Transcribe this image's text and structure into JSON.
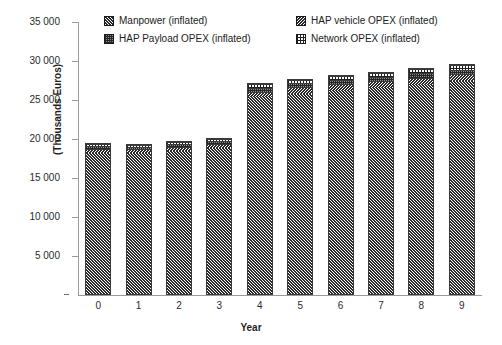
{
  "chart_data": {
    "type": "bar",
    "stacked": true,
    "title": "",
    "xlabel": "Year",
    "ylabel": "(Thousands Euros)",
    "categories": [
      "0",
      "1",
      "2",
      "3",
      "4",
      "5",
      "6",
      "7",
      "8",
      "9"
    ],
    "ylim": [
      0,
      35000
    ],
    "ytick_values": [
      0,
      5000,
      10000,
      15000,
      20000,
      25000,
      30000,
      35000
    ],
    "ytick_labels": [
      "-",
      "5 000",
      "10 000",
      "15 000",
      "20 000",
      "25 000",
      "30 000",
      "35 000"
    ],
    "grid": false,
    "legend_position": "top",
    "series": [
      {
        "name": "Manpower (inflated)",
        "pattern": "diagonal-hatch",
        "values": [
          18100,
          18050,
          18300,
          18700,
          25200,
          25700,
          26100,
          26500,
          26900,
          27300
        ]
      },
      {
        "name": "HAP vehicle OPEX (inflated)",
        "pattern": "diagonal-hatch-reverse",
        "values": [
          500,
          500,
          520,
          540,
          750,
          780,
          800,
          820,
          840,
          860
        ]
      },
      {
        "name": "HAP Payload OPEX (inflated)",
        "pattern": "dense-checker",
        "values": [
          350,
          350,
          360,
          370,
          500,
          520,
          540,
          560,
          580,
          600
        ]
      },
      {
        "name": "Network OPEX (inflated)",
        "pattern": "grid-lines",
        "values": [
          250,
          250,
          260,
          270,
          450,
          470,
          490,
          510,
          530,
          550
        ]
      }
    ],
    "totals": [
      19200,
      19150,
      19440,
      19880,
      26900,
      27470,
      27930,
      28390,
      28850,
      29310
    ]
  },
  "legend": {
    "items": [
      {
        "label": "Manpower (inflated)",
        "pattern_class": "pat-manpower"
      },
      {
        "label": "HAP vehicle OPEX (inflated)",
        "pattern_class": "pat-vehicle"
      },
      {
        "label": "HAP Payload OPEX (inflated)",
        "pattern_class": "pat-payload"
      },
      {
        "label": "Network OPEX (inflated)",
        "pattern_class": "pat-network"
      }
    ]
  },
  "colors": {
    "axis": "#9a9a9a",
    "text": "#2b2b2b",
    "bar_outline": "#3a3a3a",
    "background": "#ffffff"
  }
}
